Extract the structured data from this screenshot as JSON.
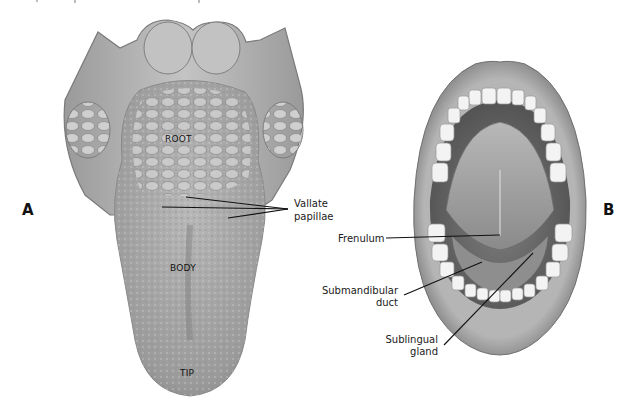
{
  "figure": {
    "panel_a": {
      "letter": "A",
      "subject": "tongue-dorsal-surface",
      "regions": {
        "root": "ROOT",
        "body": "BODY",
        "tip": "TIP"
      },
      "callouts": {
        "vallate_papillae_line1": "Vallate",
        "vallate_papillae_line2": "papillae"
      }
    },
    "panel_b": {
      "letter": "B",
      "subject": "open-mouth-floor",
      "callouts": {
        "frenulum": "Frenulum",
        "submandibular_line1": "Submandibular",
        "submandibular_line2": "duct",
        "sublingual_line1": "Sublingual",
        "sublingual_line2": "gland"
      }
    },
    "colors": {
      "background": "#ffffff",
      "tissue_light": "#d4d4d4",
      "tissue_mid": "#a8a8a8",
      "tissue_dark": "#6e6e6e",
      "teeth": "#f2f2f2",
      "leader_line": "#111111"
    }
  }
}
